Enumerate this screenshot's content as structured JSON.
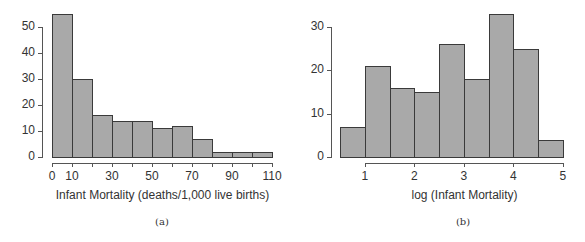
{
  "chart_data": [
    {
      "type": "bar",
      "subtype": "histogram",
      "panel": "(a)",
      "title": "",
      "xlabel": "Infant Mortality (deaths/1,000 live births)",
      "ylabel": "",
      "bins": [
        [
          0,
          10
        ],
        [
          10,
          20
        ],
        [
          20,
          30
        ],
        [
          30,
          40
        ],
        [
          40,
          50
        ],
        [
          50,
          60
        ],
        [
          60,
          70
        ],
        [
          70,
          80
        ],
        [
          80,
          90
        ],
        [
          90,
          100
        ],
        [
          100,
          110
        ]
      ],
      "categories": [
        "0-10",
        "10-20",
        "20-30",
        "30-40",
        "40-50",
        "50-60",
        "60-70",
        "70-80",
        "80-90",
        "90-100",
        "100-110"
      ],
      "values": [
        55,
        30,
        16,
        14,
        14,
        11,
        12,
        7,
        2,
        2,
        2
      ],
      "xticks": [
        0,
        10,
        30,
        50,
        70,
        90,
        110
      ],
      "yticks": [
        0,
        10,
        20,
        30,
        40,
        50
      ],
      "xlim": [
        0,
        110
      ],
      "ylim": [
        0,
        55
      ],
      "grid": false,
      "legend": null
    },
    {
      "type": "bar",
      "subtype": "histogram",
      "panel": "(b)",
      "title": "",
      "xlabel": "log (Infant Mortality)",
      "ylabel": "",
      "bins": [
        [
          0.5,
          1.0
        ],
        [
          1.0,
          1.5
        ],
        [
          1.5,
          2.0
        ],
        [
          2.0,
          2.5
        ],
        [
          2.5,
          3.0
        ],
        [
          3.0,
          3.5
        ],
        [
          3.5,
          4.0
        ],
        [
          4.0,
          4.5
        ],
        [
          4.5,
          5.0
        ]
      ],
      "categories": [
        "0.5-1.0",
        "1.0-1.5",
        "1.5-2.0",
        "2.0-2.5",
        "2.5-3.0",
        "3.0-3.5",
        "3.5-4.0",
        "4.0-4.5",
        "4.5-5.0"
      ],
      "values": [
        7,
        21,
        16,
        15,
        26,
        18,
        33,
        25,
        4
      ],
      "xticks": [
        1,
        2,
        3,
        4,
        5
      ],
      "yticks": [
        0,
        10,
        20,
        30
      ],
      "xlim": [
        0.5,
        5
      ],
      "ylim": [
        0,
        33
      ],
      "grid": false,
      "legend": null
    }
  ],
  "panels": {
    "a": {
      "caption": "(a)",
      "xlabel": "Infant Mortality (deaths/1,000 live births)",
      "ytick_labels": [
        "0",
        "10",
        "20",
        "30",
        "40",
        "50"
      ],
      "xtick_labels": [
        "0",
        "10",
        "30",
        "50",
        "70",
        "90",
        "110"
      ]
    },
    "b": {
      "caption": "(b)",
      "xlabel": "log (Infant Mortality)",
      "ytick_labels": [
        "0",
        "10",
        "20",
        "30"
      ],
      "xtick_labels": [
        "1",
        "2",
        "3",
        "4",
        "5"
      ]
    }
  },
  "colors": {
    "bar_fill": "#a9a9a9",
    "bar_edge": "#3a3a3a",
    "axis": "#555555"
  }
}
